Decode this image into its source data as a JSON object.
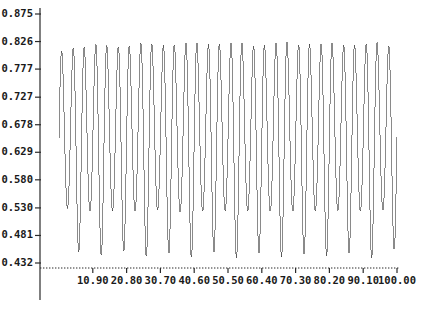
{
  "chart_data": {
    "type": "line",
    "title": "",
    "xlabel": "",
    "ylabel": "",
    "grid": false,
    "legend": null,
    "xlim": [
      1.0,
      100.0
    ],
    "ylim": [
      0.432,
      0.875
    ],
    "xticks": [
      "10.90",
      "20.80",
      "30.70",
      "40.60",
      "50.50",
      "60.40",
      "70.30",
      "80.20",
      "90.10",
      "100.00"
    ],
    "xtick_values": [
      10.9,
      20.8,
      30.7,
      40.6,
      50.5,
      60.4,
      70.3,
      80.2,
      90.1,
      100.0
    ],
    "yticks": [
      "0.875",
      "0.826",
      "0.777",
      "0.727",
      "0.678",
      "0.629",
      "0.580",
      "0.530",
      "0.481",
      "0.432"
    ],
    "ytick_values": [
      0.875,
      0.826,
      0.777,
      0.727,
      0.678,
      0.629,
      0.58,
      0.53,
      0.481,
      0.432
    ],
    "series": [
      {
        "name": "signal",
        "color": "#3c3c3c",
        "description": "rapidly oscillating amplitude-modulated waveform, about 30 visible cycles spanning x 1 to 100, peaks reaching 0.875 and troughs reaching 0.432",
        "cycles": 30,
        "baseline": 0.6535,
        "amplitude_max": 0.2215,
        "amplitude_min": 0.115,
        "x": [
          1.0,
          4.3,
          7.6,
          10.9,
          14.2,
          17.5,
          20.8,
          24.1,
          27.4,
          30.7,
          34.0,
          37.3,
          40.6,
          43.9,
          47.2,
          50.5,
          53.8,
          57.1,
          60.4,
          63.7,
          67.0,
          70.3,
          73.6,
          76.9,
          80.2,
          83.5,
          86.8,
          90.1,
          93.4,
          96.7,
          100.0
        ],
        "envelope_upper": [
          0.838,
          0.862,
          0.845,
          0.871,
          0.852,
          0.866,
          0.848,
          0.873,
          0.856,
          0.868,
          0.851,
          0.874,
          0.858,
          0.87,
          0.853,
          0.872,
          0.859,
          0.867,
          0.85,
          0.873,
          0.861,
          0.869,
          0.854,
          0.871,
          0.857,
          0.868,
          0.852,
          0.87,
          0.86,
          0.866,
          0.849
        ],
        "envelope_lower": [
          0.47,
          0.441,
          0.455,
          0.434,
          0.449,
          0.438,
          0.458,
          0.433,
          0.447,
          0.44,
          0.452,
          0.432,
          0.445,
          0.437,
          0.456,
          0.434,
          0.443,
          0.439,
          0.453,
          0.433,
          0.446,
          0.436,
          0.451,
          0.435,
          0.448,
          0.438,
          0.454,
          0.434,
          0.444,
          0.44,
          0.462
        ]
      }
    ],
    "axis": {
      "x_axis_style": "dotted",
      "y_axis_style": "solid",
      "tick_direction": "out"
    },
    "colors": {
      "curve": "#3c3c3c",
      "axis": "#2b2b2b",
      "text": "#1a1a1a",
      "background": "#ffffff"
    }
  }
}
